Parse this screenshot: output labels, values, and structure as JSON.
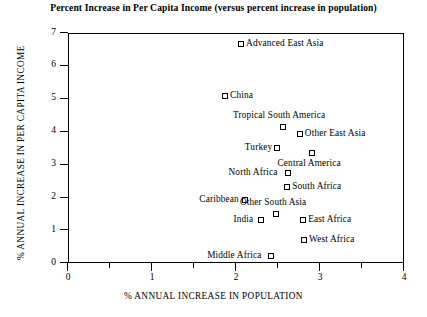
{
  "chart_data": {
    "type": "scatter",
    "title": "Percent Increase in Per Capita Income (versus percent increase in population)",
    "xlabel": "% ANNUAL INCREASE IN POPULATION",
    "ylabel": "% ANNUAL INCREASE IN PER CAPITA INCOME",
    "xlim": [
      0,
      4
    ],
    "ylim": [
      0,
      7
    ],
    "xticks": [
      "0",
      "1",
      "2",
      "3",
      "4"
    ],
    "xtick_values": [
      0,
      1,
      2,
      3,
      4
    ],
    "xminor_values": [
      0.5,
      1.5,
      2.5,
      3.5
    ],
    "yticks": [
      "0",
      "1",
      "2",
      "3",
      "4",
      "5",
      "6",
      "7"
    ],
    "ytick_values": [
      0,
      1,
      2,
      3,
      4,
      5,
      6,
      7
    ],
    "grid": false,
    "legend": "none",
    "marker": "open-square",
    "points": [
      {
        "label": "Advanced East Asia",
        "x": 2.06,
        "y": 6.66,
        "label_pos": "right"
      },
      {
        "label": "China",
        "x": 1.87,
        "y": 5.08,
        "label_pos": "right"
      },
      {
        "label": "Tropical South America",
        "x": 2.56,
        "y": 4.13,
        "label_pos": "above"
      },
      {
        "label": "Other East Asia",
        "x": 2.76,
        "y": 3.92,
        "label_pos": "right"
      },
      {
        "label": "Turkey",
        "x": 2.49,
        "y": 3.5,
        "label_pos": "left"
      },
      {
        "label": "Central America",
        "x": 2.9,
        "y": 3.34,
        "label_pos": "below"
      },
      {
        "label": "North Africa",
        "x": 2.62,
        "y": 2.74,
        "label_pos": "left"
      },
      {
        "label": "South Africa",
        "x": 2.61,
        "y": 2.31,
        "label_pos": "right"
      },
      {
        "label": "Caribbean",
        "x": 2.11,
        "y": 1.92,
        "label_pos": "left"
      },
      {
        "label": "Other South Asia",
        "x": 2.48,
        "y": 1.49,
        "label_pos": "above"
      },
      {
        "label": "India",
        "x": 2.3,
        "y": 1.31,
        "label_pos": "left"
      },
      {
        "label": "East Africa",
        "x": 2.8,
        "y": 1.31,
        "label_pos": "right"
      },
      {
        "label": "West Africa",
        "x": 2.81,
        "y": 0.7,
        "label_pos": "right"
      },
      {
        "label": "Middle Africa",
        "x": 2.42,
        "y": 0.21,
        "label_pos": "left"
      }
    ]
  }
}
